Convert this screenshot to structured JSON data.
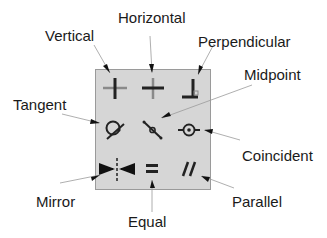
{
  "labels": {
    "vertical": "Vertical",
    "horizontal": "Horizontal",
    "perpendicular": "Perpendicular",
    "midpoint": "Midpoint",
    "tangent": "Tangent",
    "coincident": "Coincident",
    "mirror": "Mirror",
    "equal": "Equal",
    "parallel": "Parallel"
  },
  "icons": [
    {
      "name": "vertical-icon",
      "row": 1,
      "col": 1
    },
    {
      "name": "horizontal-icon",
      "row": 1,
      "col": 2
    },
    {
      "name": "perpendicular-icon",
      "row": 1,
      "col": 3
    },
    {
      "name": "tangent-icon",
      "row": 2,
      "col": 1
    },
    {
      "name": "midpoint-icon",
      "row": 2,
      "col": 2
    },
    {
      "name": "coincident-icon",
      "row": 2,
      "col": 3
    },
    {
      "name": "mirror-icon",
      "row": 3,
      "col": 1
    },
    {
      "name": "equal-icon",
      "row": 3,
      "col": 2
    },
    {
      "name": "parallel-icon",
      "row": 3,
      "col": 3
    }
  ],
  "colors": {
    "panel": "#d6d6d6",
    "icon": "#222222",
    "icon_light": "#8a8a8a",
    "leader": "#9a9a9a"
  }
}
